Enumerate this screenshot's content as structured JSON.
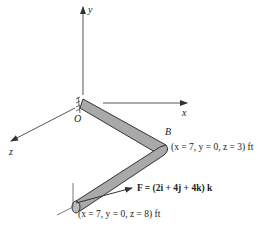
{
  "figure": {
    "axes": {
      "y": "y",
      "x": "x",
      "z": "z"
    },
    "origin_label": "O",
    "point_b_label": "B",
    "point_b_coords": "(x = 7, y = 0, z = 3) ft",
    "tip_coords": "(x = 7, y = 0, z = 8) ft",
    "force_label": "F = (2i + 4j + 4k) k"
  }
}
